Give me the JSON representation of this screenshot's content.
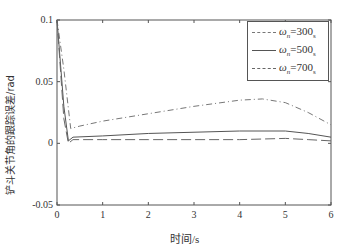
{
  "chart_data": {
    "type": "line",
    "title": "",
    "xlabel": "时间/s",
    "ylabel": "铲斗关节角的跟踪误差/rad",
    "xlim": [
      0,
      6
    ],
    "ylim": [
      -0.05,
      0.1
    ],
    "xticks": [
      "0",
      "1",
      "2",
      "3",
      "4",
      "5",
      "6"
    ],
    "yticks": [
      "-0.05",
      "0",
      "0.05",
      "0.1"
    ],
    "grid": false,
    "legend_position": "upper right",
    "series": [
      {
        "name": "ωn=300",
        "label": "ωₙ=300",
        "unit": "s",
        "style": "dash-dot",
        "x": [
          0,
          0.15,
          0.3,
          0.5,
          1,
          2,
          3,
          4,
          4.5,
          5,
          5.5,
          6
        ],
        "y": [
          0.1,
          0.06,
          0.012,
          0.014,
          0.018,
          0.024,
          0.03,
          0.035,
          0.036,
          0.033,
          0.025,
          0.015
        ]
      },
      {
        "name": "ωn=500",
        "label": "ωₙ=500",
        "unit": "s",
        "style": "solid",
        "x": [
          0,
          0.15,
          0.25,
          0.35,
          1,
          2,
          3,
          4,
          5,
          5.5,
          6
        ],
        "y": [
          0.1,
          0.03,
          0.002,
          0.005,
          0.006,
          0.008,
          0.009,
          0.01,
          0.01,
          0.008,
          0.005
        ]
      },
      {
        "name": "ωn=700",
        "label": "ωₙ=700",
        "unit": "s",
        "style": "dashed",
        "x": [
          0,
          0.15,
          0.25,
          0.35,
          1,
          2,
          3,
          4,
          5,
          5.5,
          6
        ],
        "y": [
          0.1,
          0.02,
          0.0,
          0.003,
          0.003,
          0.003,
          0.003,
          0.003,
          0.004,
          0.003,
          0.002
        ]
      }
    ]
  },
  "legend": {
    "items": [
      {
        "label": "ω",
        "sub": "n",
        "value": "=300",
        "unit": "s"
      },
      {
        "label": "ω",
        "sub": "n",
        "value": "=500",
        "unit": "s"
      },
      {
        "label": "ω",
        "sub": "n",
        "value": "=700",
        "unit": "s"
      }
    ]
  },
  "axes": {
    "xlabel": "时间/s",
    "ylabel": "铲斗关节角的跟踪误差/rad"
  }
}
